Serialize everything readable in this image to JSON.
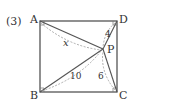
{
  "problem_number": "(3)",
  "points": {
    "A": {
      "label": "A",
      "x": 40,
      "y": 21
    },
    "D": {
      "label": "D",
      "x": 117,
      "y": 21
    },
    "B": {
      "label": "B",
      "x": 40,
      "y": 92
    },
    "C": {
      "label": "C",
      "x": 117,
      "y": 92
    },
    "P": {
      "label": "P",
      "x": 103,
      "y": 49
    }
  },
  "segment_labels": {
    "AP": "x",
    "DP": "4",
    "BP": "10",
    "CP": "6"
  },
  "colors": {
    "line": "#555555",
    "dashed": "#999999",
    "text": "#333333"
  }
}
